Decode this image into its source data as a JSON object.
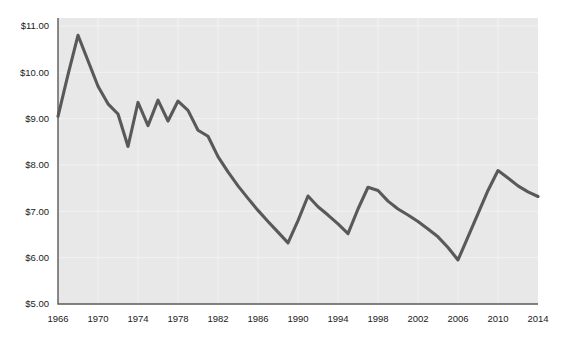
{
  "chart_data": {
    "type": "line",
    "title": "",
    "xlabel": "",
    "ylabel": "",
    "xlim": [
      1966,
      2014
    ],
    "ylim": [
      5.0,
      11.0
    ],
    "grid": true,
    "legend": "none",
    "y_tick_labels": [
      "$11.00",
      "$10.00",
      "$9.00",
      "$8.00",
      "$7.00",
      "$6.00",
      "$5.00"
    ],
    "y_tick_values": [
      11.0,
      10.0,
      9.0,
      8.0,
      7.0,
      6.0,
      5.0
    ],
    "x_tick_labels": [
      "1966",
      "1970",
      "1974",
      "1978",
      "1982",
      "1986",
      "1990",
      "1994",
      "1998",
      "2002",
      "2006",
      "2010",
      "2014"
    ],
    "x_tick_values": [
      1966,
      1970,
      1974,
      1978,
      1982,
      1986,
      1990,
      1994,
      1998,
      2002,
      2006,
      2010,
      2014
    ],
    "series": [
      {
        "name": "value",
        "color": "#595959",
        "x": [
          1966,
          1967,
          1968,
          1969,
          1970,
          1971,
          1972,
          1973,
          1974,
          1975,
          1976,
          1977,
          1978,
          1979,
          1980,
          1981,
          1982,
          1983,
          1984,
          1985,
          1986,
          1987,
          1988,
          1989,
          1990,
          1991,
          1992,
          1993,
          1994,
          1995,
          1996,
          1997,
          1998,
          1999,
          2000,
          2001,
          2002,
          2003,
          2004,
          2005,
          2006,
          2007,
          2008,
          2009,
          2010,
          2011,
          2012,
          2013,
          2014
        ],
        "values": [
          9.05,
          9.95,
          10.8,
          10.25,
          9.7,
          9.32,
          9.1,
          8.4,
          9.35,
          8.85,
          9.4,
          8.95,
          9.38,
          9.18,
          8.75,
          8.62,
          8.18,
          7.85,
          7.55,
          7.28,
          7.02,
          6.78,
          6.55,
          6.32,
          6.8,
          7.33,
          7.1,
          6.92,
          6.73,
          6.52,
          7.05,
          7.52,
          7.45,
          7.22,
          7.05,
          6.92,
          6.78,
          6.62,
          6.45,
          6.22,
          5.95,
          6.45,
          6.95,
          7.45,
          7.88,
          7.72,
          7.55,
          7.42,
          7.32
        ]
      }
    ]
  },
  "axes": {
    "plot_left": 58,
    "plot_right": 538,
    "plot_top": 18,
    "plot_bottom": 304
  }
}
